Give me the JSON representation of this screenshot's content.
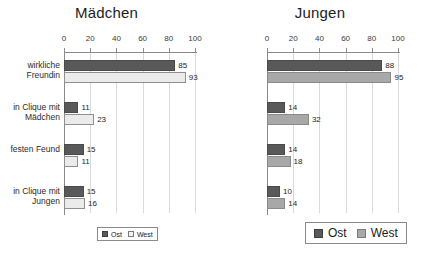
{
  "chart_data": [
    {
      "type": "bar",
      "orientation": "horizontal",
      "title": "Mädchen",
      "xlabel": "",
      "ylabel": "",
      "xlim": [
        0,
        100
      ],
      "xticks": [
        0,
        20,
        40,
        60,
        80,
        100
      ],
      "grid": true,
      "legend_position": "bottom",
      "categories": [
        "wirkliche\nFreundin",
        "in Clique mit\nMädchen",
        "festen Feund",
        "in Clique mit\nJungen"
      ],
      "series": [
        {
          "name": "Ost",
          "color": "#595959",
          "values": [
            85,
            11,
            15,
            15
          ]
        },
        {
          "name": "West",
          "color": "#ebebeb",
          "values": [
            93,
            23,
            11,
            16
          ]
        }
      ]
    },
    {
      "type": "bar",
      "orientation": "horizontal",
      "title": "Jungen",
      "xlabel": "",
      "ylabel": "",
      "xlim": [
        0,
        100
      ],
      "xticks": [
        0,
        20,
        40,
        60,
        80,
        100
      ],
      "grid": true,
      "legend_position": "bottom",
      "categories": [
        "wirklicher\nFreund",
        "in Clique mit\nJungen",
        "feste\nFeundin",
        "in Clique mit\nMädchen"
      ],
      "series": [
        {
          "name": "Ost",
          "color": "#595959",
          "values": [
            88,
            14,
            14,
            10
          ]
        },
        {
          "name": "West",
          "color": "#a8a8a8",
          "values": [
            95,
            32,
            18,
            14
          ]
        }
      ]
    }
  ]
}
